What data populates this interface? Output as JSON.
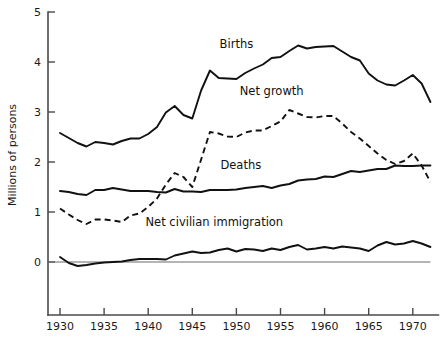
{
  "chart_data": {
    "type": "line",
    "title": "",
    "xlabel": "",
    "ylabel": "Millions of persons",
    "xlim": [
      1930,
      1972
    ],
    "ylim": [
      -1.1,
      5.0
    ],
    "grid": false,
    "legend_position": "inline-annotations",
    "y_ticks": [
      "0",
      "1",
      "2",
      "3",
      "4",
      "5"
    ],
    "y_tick_values": [
      0,
      1,
      2,
      3,
      4,
      5
    ],
    "x_ticks": [
      "1930",
      "1935",
      "1940",
      "1945",
      "1950",
      "1955",
      "1960",
      "1965",
      "1970"
    ],
    "x_tick_values": [
      1930,
      1935,
      1940,
      1945,
      1950,
      1955,
      1960,
      1965,
      1970
    ],
    "x": [
      1930,
      1931,
      1932,
      1933,
      1934,
      1935,
      1936,
      1937,
      1938,
      1939,
      1940,
      1941,
      1942,
      1943,
      1944,
      1945,
      1946,
      1947,
      1948,
      1949,
      1950,
      1951,
      1952,
      1953,
      1954,
      1955,
      1956,
      1957,
      1958,
      1959,
      1960,
      1961,
      1962,
      1963,
      1964,
      1965,
      1966,
      1967,
      1968,
      1969,
      1970,
      1971,
      1972
    ],
    "series": [
      {
        "name": "Births",
        "style": "solid",
        "label": "Births",
        "label_x": 1950.0,
        "label_y": 4.28,
        "values": [
          2.58,
          2.48,
          2.38,
          2.31,
          2.4,
          2.38,
          2.35,
          2.42,
          2.47,
          2.47,
          2.56,
          2.7,
          2.99,
          3.12,
          2.94,
          2.87,
          3.43,
          3.83,
          3.68,
          3.67,
          3.66,
          3.78,
          3.87,
          3.95,
          4.08,
          4.1,
          4.22,
          4.33,
          4.27,
          4.3,
          4.31,
          4.32,
          4.21,
          4.1,
          4.03,
          3.77,
          3.63,
          3.55,
          3.53,
          3.63,
          3.74,
          3.57,
          3.2
        ]
      },
      {
        "name": "Net growth",
        "style": "dashed",
        "label": "Net  growth",
        "label_x": 1954.0,
        "label_y": 3.35,
        "values": [
          1.07,
          0.95,
          0.84,
          0.76,
          0.85,
          0.85,
          0.83,
          0.8,
          0.93,
          0.97,
          1.1,
          1.27,
          1.55,
          1.78,
          1.7,
          1.5,
          2.05,
          2.6,
          2.57,
          2.51,
          2.5,
          2.59,
          2.63,
          2.63,
          2.72,
          2.81,
          3.04,
          2.97,
          2.9,
          2.89,
          2.92,
          2.92,
          2.77,
          2.6,
          2.47,
          2.32,
          2.17,
          2.04,
          1.96,
          2.02,
          2.17,
          1.93,
          1.6
        ]
      },
      {
        "name": "Deaths",
        "style": "solid",
        "label": "Deaths",
        "label_x": 1950.5,
        "label_y": 1.87,
        "values": [
          1.42,
          1.4,
          1.36,
          1.34,
          1.44,
          1.44,
          1.48,
          1.45,
          1.42,
          1.42,
          1.42,
          1.4,
          1.39,
          1.46,
          1.41,
          1.41,
          1.4,
          1.44,
          1.44,
          1.44,
          1.45,
          1.48,
          1.5,
          1.52,
          1.48,
          1.53,
          1.56,
          1.63,
          1.65,
          1.66,
          1.71,
          1.7,
          1.76,
          1.82,
          1.8,
          1.83,
          1.86,
          1.86,
          1.93,
          1.92,
          1.92,
          1.93,
          1.93
        ]
      },
      {
        "name": "Net civilian immigration",
        "style": "solid",
        "label": "Net civilian immigration",
        "label_x": 1947.5,
        "label_y": 0.72,
        "values": [
          0.1,
          -0.02,
          -0.08,
          -0.06,
          -0.03,
          -0.01,
          0.0,
          0.01,
          0.04,
          0.06,
          0.06,
          0.06,
          0.05,
          0.13,
          0.17,
          0.21,
          0.18,
          0.19,
          0.24,
          0.27,
          0.21,
          0.26,
          0.25,
          0.22,
          0.27,
          0.24,
          0.3,
          0.34,
          0.25,
          0.27,
          0.3,
          0.27,
          0.31,
          0.29,
          0.27,
          0.22,
          0.33,
          0.4,
          0.35,
          0.37,
          0.42,
          0.37,
          0.3
        ]
      }
    ]
  },
  "colors": {
    "line": "#111111",
    "axis": "#4a4a4a",
    "background": "#ffffff"
  }
}
